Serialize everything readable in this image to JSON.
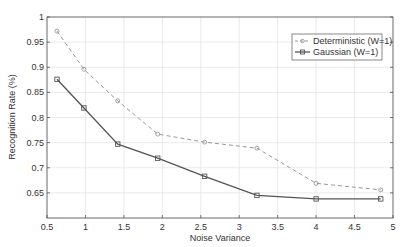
{
  "chart_data": {
    "type": "line",
    "title": "",
    "xlabel": "Noise Variance",
    "ylabel": "Recognition Rate (%)",
    "xlim": [
      0.5,
      5
    ],
    "ylim": [
      0.6,
      1
    ],
    "xticks": [
      0.5,
      1,
      1.5,
      2,
      2.5,
      3,
      3.5,
      4,
      4.5,
      5
    ],
    "xtick_labels": [
      "0.5",
      "1",
      "1.5",
      "2",
      "2.5",
      "3",
      "3.5",
      "4",
      "4.5",
      "5"
    ],
    "yticks": [
      0.65,
      0.7,
      0.75,
      0.8,
      0.85,
      0.9,
      0.95,
      1
    ],
    "ytick_labels": [
      "0.65",
      "0.7",
      "0.75",
      "0.8",
      "0.85",
      "0.9",
      "0.95",
      "1"
    ],
    "grid": true,
    "legend_position": "upper right",
    "x": [
      0.63,
      0.98,
      1.42,
      1.94,
      2.55,
      3.23,
      4.0,
      4.84
    ],
    "series": [
      {
        "name": "Deterministic (W=1)",
        "values": [
          0.972,
          0.896,
          0.833,
          0.767,
          0.751,
          0.739,
          0.669,
          0.656
        ],
        "color": "#999999",
        "linestyle": "dashed",
        "marker": "circle"
      },
      {
        "name": "Gaussian (W=1)",
        "values": [
          0.876,
          0.819,
          0.747,
          0.719,
          0.683,
          0.645,
          0.638,
          0.638
        ],
        "color": "#555555",
        "linestyle": "solid",
        "marker": "square"
      }
    ]
  }
}
